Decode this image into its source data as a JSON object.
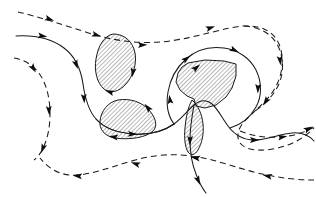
{
  "figure": {
    "width": 316,
    "height": 197,
    "background_color": "#ffffff",
    "line_color": "#1a1a1a",
    "hatch_color": "#1a1a1a",
    "arrow_color": "#0d0d0d"
  },
  "legend_style": {
    "solid_meaning": "solid streamline",
    "dashed_meaning": "dashed streamline",
    "hatch_meaning": "hatched region",
    "arrow_meaning": "flow direction marker"
  },
  "hatch": {
    "angle_deg": 45,
    "spacing_px": 3,
    "stroke_width": 0.6
  },
  "regions": [
    {
      "name": "upper-lens-region",
      "shape": "lens",
      "hatched": true,
      "path": "M 113 34 C 125 34 133 42 135 53 C 137 64 133 76 126 84 C 119 92 110 94 104 89 C 97 83 94 71 96 59 C 98 46 104 36 113 34 Z"
    },
    {
      "name": "lower-blob-region",
      "shape": "blob",
      "hatched": true,
      "path": "M 118 100 C 130 98 142 102 149 110 C 156 118 158 126 153 131 C 146 138 128 140 115 138 C 104 136 99 129 100 121 C 101 111 108 102 118 100 Z"
    },
    {
      "name": "right-polygon-region",
      "shape": "polygon",
      "hatched": true,
      "path": "M 188 63 L 205 60 L 224 61 L 236 64 L 236 76 L 232 88 L 226 97 L 216 105 L 205 108 L 196 106 L 194 99 L 187 96 L 180 90 L 176 82 L 178 73 L 182 67 Z"
    },
    {
      "name": "center-connector-region",
      "shape": "narrow-band",
      "hatched": true,
      "path": "M 192 100 C 198 105 202 114 203 124 C 204 134 202 143 198 150 C 195 155 191 156 188 152 C 185 147 184 138 185 128 C 186 117 188 107 192 100 Z"
    }
  ],
  "streamlines": [
    {
      "name": "top-dashed-streamline",
      "style": "dashed",
      "direction": "left-to-right",
      "path": "M 18 12 C 40 17 66 26 92 34 C 118 42 148 45 176 40 C 202 36 226 27 244 26 C 262 25 274 32 279 44 C 284 56 283 70 278 82 C 273 94 264 103 256 110"
    },
    {
      "name": "top-dashed-return-streamline",
      "style": "dashed",
      "direction": "continues-right",
      "path": "M 256 110 C 249 117 242 122 239 130 C 236 138 239 145 247 148 C 258 152 274 150 288 145 C 299 141 308 134 314 128"
    },
    {
      "name": "middle-solid-streamline",
      "style": "solid",
      "direction": "left-to-right",
      "path": "M 16 36 C 34 35 52 39 64 48 C 76 57 81 70 83 84 C 85 98 88 110 96 119 C 104 128 118 133 134 134 C 150 135 164 131 174 124"
    },
    {
      "name": "middle-solid-continuation",
      "style": "solid",
      "direction": "continues-right",
      "path": "M 174 124 C 182 118 188 110 194 105 C 200 100 206 99 212 104 C 218 109 222 118 228 126 C 234 134 243 140 254 140 C 266 140 280 134 292 133 C 302 132 310 136 314 141"
    },
    {
      "name": "lower-dashed-streamline",
      "style": "dashed",
      "direction": "right-to-left",
      "path": "M 314 180 C 298 180 280 178 262 174 C 244 170 228 164 212 160 C 196 156 180 154 164 155 C 146 156 128 162 112 167 C 96 172 82 176 70 175 C 58 174 48 168 40 158"
    },
    {
      "name": "lower-left-dashed-streamline",
      "style": "dashed",
      "direction": "left-to-right",
      "path": "M 14 58 C 26 60 36 67 42 78 C 48 89 50 102 50 114 C 50 126 48 137 44 146 C 41 153 38 157 34 160"
    },
    {
      "name": "right-inner-solid-loop",
      "style": "solid",
      "direction": "clockwise",
      "path": "M 174 124 C 168 116 166 104 168 92 C 170 80 176 68 186 59 C 196 50 210 46 224 48 C 238 50 250 58 256 70 C 262 82 262 96 256 107 C 250 118 240 125 230 128"
    },
    {
      "name": "right-outer-dashed-loop",
      "style": "dashed",
      "direction": "clockwise",
      "path": "M 244 26 C 260 27 272 34 278 46 C 284 58 284 74 278 86 C 272 98 262 106 254 112"
    },
    {
      "name": "center-lower-solid-branch",
      "style": "solid",
      "direction": "downward",
      "path": "M 194 105 C 192 116 190 128 190 140 C 190 152 192 164 196 174 C 199 182 202 188 206 193"
    },
    {
      "name": "lower-center-solid-sweep",
      "style": "solid",
      "direction": "left-to-right",
      "path": "M 96 119 C 104 128 118 133 134 134 C 150 135 164 131 174 124"
    },
    {
      "name": "bottom-right-dashed-exit",
      "style": "dashed",
      "direction": "left-to-right",
      "path": "M 240 131 C 252 136 266 138 280 137 C 294 136 306 132 314 127"
    }
  ],
  "arrow_markers": [
    {
      "name": "arrow-top-dashed-1",
      "x": 49,
      "y": 19,
      "angle": 20
    },
    {
      "name": "arrow-top-dashed-2",
      "x": 96,
      "y": 35,
      "angle": 17
    },
    {
      "name": "arrow-top-dashed-3",
      "x": 142,
      "y": 45,
      "angle": -2
    },
    {
      "name": "arrow-top-dashed-4",
      "x": 210,
      "y": 28,
      "angle": -18
    },
    {
      "name": "arrow-top-dashed-5",
      "x": 280,
      "y": 60,
      "angle": 84
    },
    {
      "name": "arrow-top-dashed-6",
      "x": 266,
      "y": 101,
      "angle": 125
    },
    {
      "name": "arrow-mid-solid-1",
      "x": 42,
      "y": 36,
      "angle": 8
    },
    {
      "name": "arrow-mid-solid-2",
      "x": 76,
      "y": 64,
      "angle": 70
    },
    {
      "name": "arrow-mid-solid-3",
      "x": 84,
      "y": 98,
      "angle": 86
    },
    {
      "name": "arrow-mid-solid-4",
      "x": 132,
      "y": 134,
      "angle": 2
    },
    {
      "name": "arrow-mid-solid-5",
      "x": 196,
      "y": 68,
      "angle": -40
    },
    {
      "name": "arrow-mid-solid-6",
      "x": 254,
      "y": 140,
      "angle": 0
    },
    {
      "name": "arrow-left-dashed-1",
      "x": 33,
      "y": 68,
      "angle": 58
    },
    {
      "name": "arrow-left-dashed-2",
      "x": 49,
      "y": 110,
      "angle": 86
    },
    {
      "name": "arrow-left-dashed-3",
      "x": 43,
      "y": 148,
      "angle": 110
    },
    {
      "name": "arrow-low-dashed-1",
      "x": 268,
      "y": 176,
      "angle": 192
    },
    {
      "name": "arrow-low-dashed-2",
      "x": 196,
      "y": 158,
      "angle": 190
    },
    {
      "name": "arrow-low-dashed-3",
      "x": 136,
      "y": 164,
      "angle": 198
    },
    {
      "name": "arrow-low-dashed-4",
      "x": 78,
      "y": 176,
      "angle": 186
    },
    {
      "name": "arrow-inner-loop-1",
      "x": 186,
      "y": 59,
      "angle": -38
    },
    {
      "name": "arrow-inner-loop-2",
      "x": 234,
      "y": 50,
      "angle": 26
    },
    {
      "name": "arrow-inner-loop-3",
      "x": 258,
      "y": 88,
      "angle": 92
    },
    {
      "name": "arrow-inner-loop-4",
      "x": 170,
      "y": 100,
      "angle": 262
    },
    {
      "name": "arrow-center-down-1",
      "x": 190,
      "y": 140,
      "angle": 92
    },
    {
      "name": "arrow-center-down-2",
      "x": 198,
      "y": 180,
      "angle": 66
    },
    {
      "name": "arrow-right-dashed-1",
      "x": 282,
      "y": 137,
      "angle": -8
    },
    {
      "name": "arrow-right-dashed-2",
      "x": 308,
      "y": 129,
      "angle": -28
    },
    {
      "name": "arrow-lens-1",
      "x": 133,
      "y": 72,
      "angle": 100
    },
    {
      "name": "arrow-lens-2",
      "x": 110,
      "y": 92,
      "angle": 200
    },
    {
      "name": "arrow-blob-1",
      "x": 148,
      "y": 108,
      "angle": 230
    },
    {
      "name": "arrow-blob-2",
      "x": 114,
      "y": 137,
      "angle": 188
    }
  ]
}
